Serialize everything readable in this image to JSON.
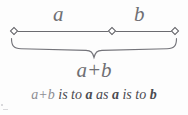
{
  "figure": {
    "type": "golden-ratio-line-segment-diagram",
    "labels": {
      "segment_a": "a",
      "segment_b": "b",
      "total": "a+b"
    },
    "caption": {
      "lead": "a+b",
      "part1": " is to ",
      "term1": "a",
      "part2": " as ",
      "term2": "a",
      "part3": " is to ",
      "term3": "b",
      "full_text": "a+b is to a as a is to b"
    },
    "colors": {
      "line": "#6b6b70",
      "label": "#6f6f73",
      "caption": "#4a4a50",
      "caption_lead": "#8d8d93",
      "background": "#fdfdfd"
    },
    "geometry": {
      "line_start_x": 14,
      "line_mid_x": 112,
      "line_end_x": 175,
      "line_y": 31,
      "node_count": 3,
      "node_shape": "diamond"
    }
  }
}
